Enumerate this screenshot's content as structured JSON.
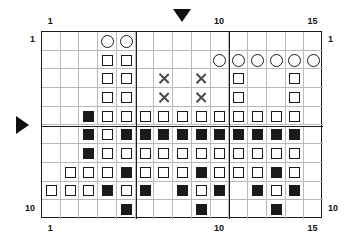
{
  "chart_data": {
    "type": "heatmap",
    "title": "",
    "xlabel": "",
    "ylabel": "",
    "columns": 15,
    "rows": 10,
    "xlim": [
      1,
      15
    ],
    "ylim": [
      1,
      10
    ],
    "grid": true,
    "legend": "none",
    "axis_ticks": {
      "top": [
        {
          "value": 1,
          "label": "1"
        },
        {
          "value": 10,
          "label": "10"
        },
        {
          "value": 15,
          "label": "15"
        }
      ],
      "bottom": [
        {
          "value": 1,
          "label": "1"
        },
        {
          "value": 10,
          "label": "10"
        },
        {
          "value": 15,
          "label": "15"
        }
      ],
      "left": [
        {
          "value": 1,
          "label": "1"
        },
        {
          "value": 10,
          "label": "10"
        }
      ],
      "right": [
        {
          "value": 1,
          "label": "1"
        },
        {
          "value": 10,
          "label": "10"
        }
      ]
    },
    "heavy_gridlines": {
      "vertical_after_columns": [
        5,
        10
      ],
      "horizontal_after_rows": [
        5
      ]
    },
    "markers": [
      {
        "name": "top-pointer",
        "shape": "triangle-down",
        "column": 8
      },
      {
        "name": "left-pointer",
        "shape": "triangle-right",
        "row": 5
      }
    ],
    "symbol_legend": [
      {
        "key": "circle",
        "glyph": "O",
        "name": "circle"
      },
      {
        "key": "open_square",
        "glyph": "square-outline",
        "name": "open-square"
      },
      {
        "key": "filled_square",
        "glyph": "square-filled",
        "name": "filled-square"
      },
      {
        "key": "cross",
        "glyph": "X",
        "name": "cross"
      },
      {
        "key": "empty",
        "glyph": "",
        "name": "empty"
      }
    ],
    "cells": [
      [
        "empty",
        "empty",
        "empty",
        "circle",
        "circle",
        "empty",
        "empty",
        "empty",
        "empty",
        "empty",
        "empty",
        "empty",
        "empty",
        "empty",
        "empty"
      ],
      [
        "empty",
        "empty",
        "empty",
        "open_square",
        "open_square",
        "empty",
        "empty",
        "empty",
        "empty",
        "circle",
        "circle",
        "circle",
        "circle",
        "circle",
        "circle"
      ],
      [
        "empty",
        "empty",
        "empty",
        "open_square",
        "open_square",
        "empty",
        "cross",
        "empty",
        "cross",
        "empty",
        "open_square",
        "empty",
        "empty",
        "open_square",
        "empty"
      ],
      [
        "empty",
        "empty",
        "empty",
        "open_square",
        "open_square",
        "empty",
        "cross",
        "empty",
        "cross",
        "empty",
        "open_square",
        "empty",
        "empty",
        "open_square",
        "empty"
      ],
      [
        "empty",
        "empty",
        "filled_square",
        "open_square",
        "open_square",
        "open_square",
        "open_square",
        "open_square",
        "open_square",
        "open_square",
        "open_square",
        "open_square",
        "open_square",
        "open_square",
        "empty"
      ],
      [
        "empty",
        "empty",
        "filled_square",
        "open_square",
        "filled_square",
        "filled_square",
        "filled_square",
        "filled_square",
        "filled_square",
        "filled_square",
        "filled_square",
        "filled_square",
        "filled_square",
        "filled_square",
        "empty"
      ],
      [
        "empty",
        "empty",
        "filled_square",
        "open_square",
        "open_square",
        "open_square",
        "open_square",
        "open_square",
        "open_square",
        "open_square",
        "open_square",
        "open_square",
        "open_square",
        "open_square",
        "empty"
      ],
      [
        "empty",
        "open_square",
        "open_square",
        "open_square",
        "filled_square",
        "open_square",
        "open_square",
        "open_square",
        "filled_square",
        "open_square",
        "open_square",
        "open_square",
        "filled_square",
        "open_square",
        "empty"
      ],
      [
        "open_square",
        "open_square",
        "open_square",
        "filled_square",
        "open_square",
        "filled_square",
        "empty",
        "filled_square",
        "open_square",
        "filled_square",
        "empty",
        "filled_square",
        "open_square",
        "filled_square",
        "empty"
      ],
      [
        "empty",
        "empty",
        "empty",
        "empty",
        "filled_square",
        "empty",
        "empty",
        "empty",
        "filled_square",
        "empty",
        "empty",
        "empty",
        "filled_square",
        "empty",
        "empty"
      ]
    ]
  }
}
